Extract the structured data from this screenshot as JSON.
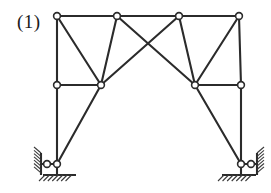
{
  "figure": {
    "label": "(1)",
    "caption_position": "top-left",
    "kind": "planar-truss-frame"
  },
  "style": {
    "member_color": "#2b2b2b",
    "member_width": 2.1,
    "node_stroke": "#2b2b2b",
    "node_fill": "#ffffff",
    "node_radius": 3.4,
    "hatch_color": "#3a3a3a",
    "background": "#ffffff"
  },
  "geometry": {
    "nodes": [
      {
        "id": "T1",
        "name": "top-left-node",
        "x": 57,
        "y": 16
      },
      {
        "id": "T2",
        "name": "top-inner-left-node",
        "x": 117,
        "y": 16
      },
      {
        "id": "T3",
        "name": "top-inner-right-node",
        "x": 179,
        "y": 16
      },
      {
        "id": "T4",
        "name": "top-right-node",
        "x": 239,
        "y": 16
      },
      {
        "id": "M1",
        "name": "mid-left-node",
        "x": 57,
        "y": 85
      },
      {
        "id": "M2",
        "name": "left-apex-node",
        "x": 101,
        "y": 85
      },
      {
        "id": "M3",
        "name": "right-apex-node",
        "x": 195,
        "y": 85
      },
      {
        "id": "M4",
        "name": "mid-right-node",
        "x": 241,
        "y": 85
      },
      {
        "id": "B1",
        "name": "left-support-node",
        "x": 57,
        "y": 164
      },
      {
        "id": "B2",
        "name": "right-support-node",
        "x": 241,
        "y": 164
      }
    ],
    "members": [
      {
        "from": "T1",
        "to": "T2",
        "name": "top-chord-1"
      },
      {
        "from": "T2",
        "to": "T3",
        "name": "top-chord-2"
      },
      {
        "from": "T3",
        "to": "T4",
        "name": "top-chord-3"
      },
      {
        "from": "T1",
        "to": "M1",
        "name": "left-upper-post"
      },
      {
        "from": "T4",
        "to": "M4",
        "name": "right-upper-post"
      },
      {
        "from": "M1",
        "to": "M2",
        "name": "left-mid-chord"
      },
      {
        "from": "M3",
        "to": "M4",
        "name": "right-mid-chord"
      },
      {
        "from": "T1",
        "to": "M2",
        "name": "left-outer-diagonal"
      },
      {
        "from": "T2",
        "to": "M2",
        "name": "left-inner-diagonal"
      },
      {
        "from": "T4",
        "to": "M3",
        "name": "right-outer-diagonal"
      },
      {
        "from": "T3",
        "to": "M3",
        "name": "right-inner-diagonal"
      },
      {
        "from": "T2",
        "to": "M3",
        "name": "cross-diagonal-left-to-right"
      },
      {
        "from": "T3",
        "to": "M2",
        "name": "cross-diagonal-right-to-left"
      },
      {
        "from": "M1",
        "to": "B1",
        "name": "left-lower-post"
      },
      {
        "from": "M4",
        "to": "B2",
        "name": "right-lower-post"
      },
      {
        "from": "M2",
        "to": "B1",
        "name": "left-lower-brace"
      },
      {
        "from": "M3",
        "to": "B2",
        "name": "right-lower-brace"
      }
    ],
    "supports": [
      {
        "id": "S_L",
        "name": "left-support",
        "node": "B1",
        "wall": {
          "x": 41,
          "y_top": 153,
          "y_bottom": 175,
          "side": "left",
          "link_from_x": 41,
          "link_to_x": 57,
          "link_y": 164
        },
        "ground": {
          "x_left": 43,
          "x_right": 76,
          "y": 175
        }
      },
      {
        "id": "S_R",
        "name": "right-support",
        "node": "B2",
        "wall": {
          "x": 257,
          "y_top": 153,
          "y_bottom": 175,
          "side": "right",
          "link_from_x": 257,
          "link_to_x": 241,
          "link_y": 164
        },
        "ground": {
          "x_left": 222,
          "x_right": 256,
          "y": 175
        }
      }
    ]
  }
}
